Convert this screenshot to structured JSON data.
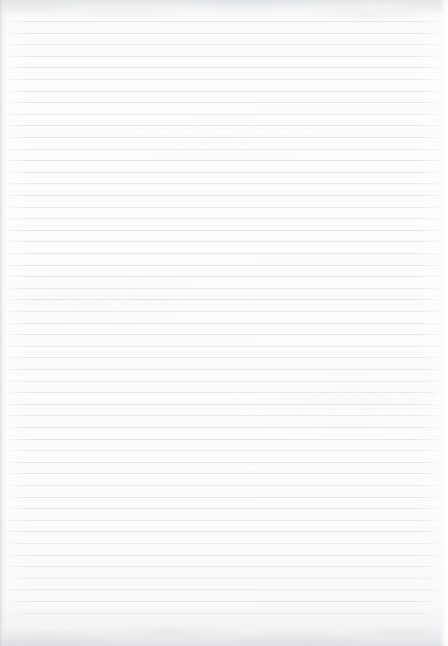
{
  "document": {
    "kind": "scanned-ruled-paper",
    "title": "Blank Ruled Notebook Page",
    "page_width": 448,
    "page_height": 646,
    "content_text": "",
    "has_visible_text": false,
    "has_handwriting": false,
    "orientation": "portrait"
  },
  "paper": {
    "background_color": "#fcfcfc",
    "edge_tint_color": "#eef0f1",
    "grain_color": "#b0b4b8",
    "left_edge_shadow_color": "#c6cace",
    "top_band_color": "#cdd1d5",
    "bottom_band_color": "#c8ccd0"
  },
  "ruling": {
    "line_color": "#e4e6e8",
    "line_thickness": 1,
    "line_spacing": 11.6,
    "first_line_y": 21,
    "line_count": 52,
    "line_left_x": 3,
    "line_width": 439,
    "margin_rule_visible": false
  }
}
